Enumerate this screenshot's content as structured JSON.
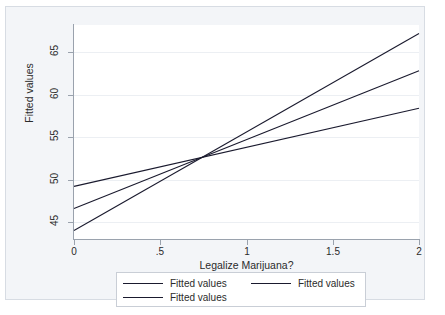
{
  "chart_data": {
    "type": "line",
    "title": "",
    "xlabel": "Legalize Marijuana?",
    "ylabel": "Fitted values",
    "xlim": [
      0,
      2
    ],
    "ylim": [
      43.0,
      68.2
    ],
    "xticks": [
      0,
      0.5,
      1,
      1.5,
      2
    ],
    "xtick_labels": [
      "0",
      ".5",
      "1",
      "1.5",
      "2"
    ],
    "yticks": [
      45,
      50,
      55,
      60,
      65
    ],
    "ytick_labels": [
      "45",
      "50",
      "55",
      "60",
      "65"
    ],
    "grid": true,
    "legend_position": "bottom",
    "series": [
      {
        "name": "Fitted values",
        "color": "#1a1a2e",
        "x": [
          0,
          2
        ],
        "values": [
          49.2,
          58.4
        ],
        "intercept": 49.2,
        "slope": 4.6
      },
      {
        "name": "Fitted values",
        "color": "#1a1a2e",
        "x": [
          0,
          2
        ],
        "values": [
          46.6,
          62.8
        ],
        "intercept": 46.6,
        "slope": 8.1
      },
      {
        "name": "Fitted values",
        "color": "#1a1a2e",
        "x": [
          0,
          2
        ],
        "values": [
          44.0,
          67.2
        ],
        "intercept": 44.0,
        "slope": 11.6
      }
    ],
    "annotations": []
  },
  "axes": {
    "y_title": "Fitted values",
    "x_title": "Legalize Marijuana?"
  },
  "legend": {
    "entries": [
      {
        "label": "Fitted values"
      },
      {
        "label": "Fitted values"
      },
      {
        "label": "Fitted values"
      }
    ]
  },
  "colors": {
    "line": "#1a1a2e",
    "frame_background": "#f3f5f8",
    "frame_border": "#d7dce3",
    "plot_background": "#ffffff",
    "axis": "#9aa2ad",
    "gridline": "#eceff3",
    "text": "#2b2b2b",
    "legend_border": "#c9ced6"
  }
}
